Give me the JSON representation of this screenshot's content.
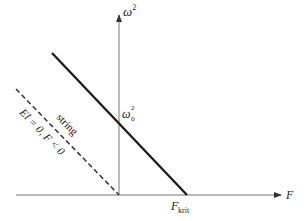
{
  "diagram": {
    "y_axis_label": "ω",
    "y_axis_label_sup": "2",
    "x_axis_label": "F",
    "intercept_label": "ω",
    "intercept_label_sub": "0",
    "intercept_label_sup": "2",
    "critical_label": "F",
    "critical_label_sub": "krit",
    "dashed_line_label_1": "string",
    "dashed_line_label_2": "EI = 0, F < 0",
    "colors": {
      "axis": "#555555",
      "solid_line": "#1a1a1a",
      "dashed_line": "#333333",
      "text": "#222222"
    }
  }
}
